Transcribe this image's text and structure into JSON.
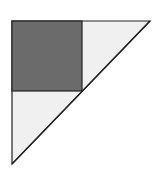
{
  "diagram": {
    "colors": {
      "background": "#ffffff",
      "triangle_fill": "#f0f0f0",
      "square_fill": "#6b6b6b",
      "stroke": "#222222"
    },
    "triangle": {
      "points": [
        [
          12,
          21
        ],
        [
          150,
          21
        ],
        [
          12,
          164
        ]
      ]
    },
    "square": {
      "x": 12,
      "y": 21,
      "size": 70
    }
  }
}
